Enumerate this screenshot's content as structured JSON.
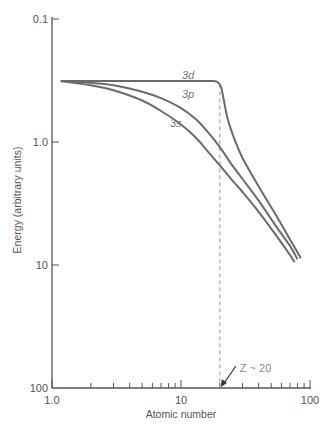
{
  "chart_data": {
    "type": "line",
    "title": "",
    "xlabel": "Atomic number",
    "ylabel": "Energy (arbitrary units)",
    "x_scale": "log",
    "y_scale": "log",
    "y_inverted": true,
    "xlim": [
      1,
      100
    ],
    "ylim": [
      0.1,
      100
    ],
    "x_ticks": [
      {
        "value": 1,
        "label": "1.0"
      },
      {
        "value": 10,
        "label": "10"
      },
      {
        "value": 100,
        "label": "100"
      }
    ],
    "x_minor_ticks": [
      2,
      3,
      4,
      5,
      6,
      7,
      8,
      9,
      20,
      30,
      40,
      50,
      60,
      70,
      80,
      90
    ],
    "y_ticks": [
      {
        "value": 0.1,
        "label": "0.1"
      },
      {
        "value": 1,
        "label": "1.0"
      },
      {
        "value": 10,
        "label": "10"
      },
      {
        "value": 100,
        "label": "100"
      }
    ],
    "grid": false,
    "legend": "none",
    "series": [
      {
        "name": "3d",
        "label": "3d",
        "x": [
          1.17,
          3,
          6,
          10,
          15,
          18,
          19.5,
          20.5,
          21.5,
          23,
          26,
          30,
          40,
          55,
          70,
          85
        ],
        "y": [
          0.32,
          0.32,
          0.32,
          0.32,
          0.32,
          0.32,
          0.33,
          0.36,
          0.46,
          0.65,
          0.95,
          1.35,
          2.3,
          4.0,
          6.2,
          8.8
        ]
      },
      {
        "name": "3p",
        "label": "3p",
        "x": [
          1.17,
          2,
          3,
          5,
          7,
          10,
          13,
          16,
          20,
          25,
          30,
          40,
          55,
          70,
          80
        ],
        "y": [
          0.32,
          0.33,
          0.345,
          0.39,
          0.44,
          0.53,
          0.65,
          0.82,
          1.1,
          1.55,
          2.0,
          3.0,
          4.9,
          7.0,
          9.0
        ]
      },
      {
        "name": "3s",
        "label": "3s",
        "x": [
          1.17,
          2,
          3,
          5,
          7,
          10,
          13,
          16,
          20,
          25,
          30,
          40,
          55,
          70,
          76
        ],
        "y": [
          0.32,
          0.345,
          0.38,
          0.46,
          0.56,
          0.72,
          0.92,
          1.18,
          1.55,
          2.05,
          2.55,
          3.7,
          5.8,
          8.3,
          9.5
        ]
      }
    ],
    "annotations": [
      {
        "text": "Z ~ 20",
        "x": 20,
        "type": "dashed-vertical-line-with-arrow"
      }
    ]
  }
}
